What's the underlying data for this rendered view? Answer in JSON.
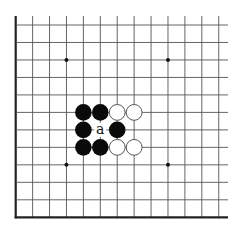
{
  "diagram": {
    "type": "go-board-fragment",
    "corner": "bottom-left",
    "columns": 13,
    "rows": 12,
    "origin_x": 15.7,
    "origin_y": 25,
    "spacing_x": 16.92,
    "spacing_y": 17.48,
    "line_top": 16,
    "line_right": 228,
    "colors": {
      "line": "#555555",
      "edge": "#222222",
      "black_stone": "#0a0a0a",
      "white_stone_fill": "#ffffff",
      "white_stone_stroke": "#444444",
      "star_point": "#111111",
      "background": "#ffffff"
    },
    "star_points": [
      {
        "col": 3,
        "row": 2
      },
      {
        "col": 9,
        "row": 2
      },
      {
        "col": 3,
        "row": 8
      },
      {
        "col": 9,
        "row": 8
      }
    ],
    "stones": [
      {
        "col": 4,
        "row": 5,
        "color": "black"
      },
      {
        "col": 5,
        "row": 5,
        "color": "black"
      },
      {
        "col": 6,
        "row": 5,
        "color": "white"
      },
      {
        "col": 7,
        "row": 5,
        "color": "white"
      },
      {
        "col": 4,
        "row": 6,
        "color": "black"
      },
      {
        "col": 6,
        "row": 6,
        "color": "black"
      },
      {
        "col": 4,
        "row": 7,
        "color": "black"
      },
      {
        "col": 5,
        "row": 7,
        "color": "black"
      },
      {
        "col": 6,
        "row": 7,
        "color": "white"
      },
      {
        "col": 7,
        "row": 7,
        "color": "white"
      }
    ],
    "labels": [
      {
        "col": 5,
        "row": 6,
        "text": "a"
      }
    ]
  }
}
